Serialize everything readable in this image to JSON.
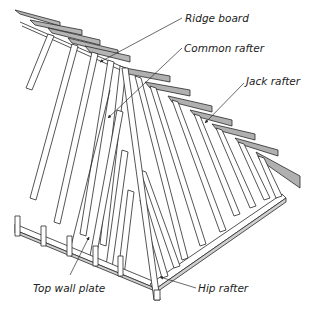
{
  "diagram": {
    "type": "hip roof framing illustration",
    "colors": {
      "stroke": "#2a2a2a",
      "timber_face": "#ffffff",
      "timber_shade": "#bdbdbd",
      "fascia": "#a9a9a9",
      "background": "#ffffff"
    },
    "labels": [
      {
        "id": "ridge-board",
        "text": "Ridge board",
        "x": 185,
        "y": 13
      },
      {
        "id": "common-rafter",
        "text": "Common rafter",
        "x": 184,
        "y": 43
      },
      {
        "id": "jack-rafter",
        "text": "Jack rafter",
        "x": 246,
        "y": 76
      },
      {
        "id": "top-wall-plate",
        "text": "Top wall plate",
        "x": 33,
        "y": 283
      },
      {
        "id": "hip-rafter",
        "text": "Hip rafter",
        "x": 198,
        "y": 283
      }
    ]
  }
}
